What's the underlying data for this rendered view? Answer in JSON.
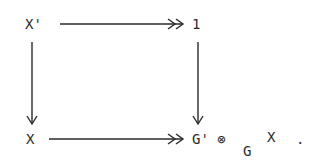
{
  "diagram": {
    "type": "commutative-square",
    "nodes": {
      "top_left": {
        "label": "X'"
      },
      "top_right": {
        "label": "1"
      },
      "bottom_left": {
        "label": "X"
      },
      "bottom_right": {
        "left_factor": "G'",
        "operator": "⊗",
        "subscript": "G",
        "right_factor": "X",
        "terminator": "."
      }
    },
    "edges": [
      {
        "from": "top_left",
        "to": "top_right",
        "style": "double-head (epimorphism)"
      },
      {
        "from": "top_left",
        "to": "bottom_left",
        "style": "single-head"
      },
      {
        "from": "top_right",
        "to": "bottom_right",
        "style": "single-head"
      },
      {
        "from": "bottom_left",
        "to": "bottom_right",
        "style": "double-head (epimorphism)"
      }
    ],
    "ink_color": "#2a2a2a",
    "background": "#ffffff"
  }
}
